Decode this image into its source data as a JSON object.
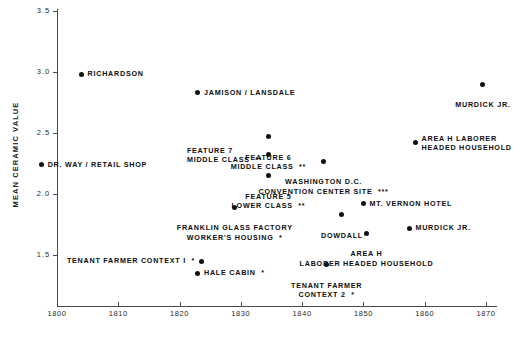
{
  "chart_data": {
    "type": "scatter",
    "title": "",
    "xlabel": "",
    "ylabel": "MEAN CERAMIC VALUE",
    "xlim": [
      1797,
      1874
    ],
    "ylim": [
      1.26,
      3.55
    ],
    "grid": false,
    "legend": "none",
    "xticks": [
      1800,
      1810,
      1820,
      1830,
      1840,
      1850,
      1860,
      1870
    ],
    "xtick_labels": [
      "1800",
      "1810",
      "1820",
      "1830",
      "1840",
      "1850",
      "1860",
      "1870"
    ],
    "yticks": [
      1.5,
      2.0,
      2.5,
      3.0,
      3.5
    ],
    "ytick_labels": [
      "1.5",
      "2.0",
      "2.5",
      "3.0",
      "3.5"
    ],
    "points": [
      {
        "label": "RICHARDSON",
        "x": 1804.0,
        "y": 2.98,
        "align": "left"
      },
      {
        "label": "JAMISON / LANSDALE",
        "x": 1823.0,
        "y": 2.83,
        "align": "left"
      },
      {
        "label": "MURDICK JR.",
        "x": 1869.5,
        "y": 2.9,
        "align": "centerb"
      },
      {
        "label": "FEATURE 6\nMIDDLE CLASS  **",
        "x": 1834.5,
        "y": 2.47,
        "align": "centerb"
      },
      {
        "label": "FEATURE 7\nMIDDLE CLASS  **",
        "x": 1834.5,
        "y": 2.32,
        "align": "right"
      },
      {
        "label": "AREA H LABORER\nHEADED HOUSEHOLD",
        "x": 1858.5,
        "y": 2.42,
        "align": "left"
      },
      {
        "label": "WASHINGTON D.C.\nCONVENTION CENTER SITE  ***",
        "x": 1843.5,
        "y": 2.27,
        "align": "centerb"
      },
      {
        "label": "DR. WAY / RETAIL SHOP",
        "x": 1797.5,
        "y": 2.24,
        "align": "left"
      },
      {
        "label": "FEATURE 5\nLOWER CLASS  **",
        "x": 1834.5,
        "y": 2.15,
        "align": "centerb"
      },
      {
        "label": "MT. VERNON HOTEL",
        "x": 1850.0,
        "y": 1.92,
        "align": "left"
      },
      {
        "label": "FRANKLIN GLASS FACTORY\nWORKER'S HOUSING  *",
        "x": 1829.0,
        "y": 1.89,
        "align": "centerb"
      },
      {
        "label": "DOWDALL",
        "x": 1846.5,
        "y": 1.83,
        "align": "centerb"
      },
      {
        "label": "MURDICK JR.",
        "x": 1857.5,
        "y": 1.72,
        "align": "left"
      },
      {
        "label": "AREA H\nLABORER HEADED HOUSEHOLD",
        "x": 1850.5,
        "y": 1.68,
        "align": "centerb"
      },
      {
        "label": "TENANT FARMER CONTEXT I  *",
        "x": 1823.5,
        "y": 1.45,
        "align": "right"
      },
      {
        "label": "HALE CABIN  *",
        "x": 1823.0,
        "y": 1.35,
        "align": "left"
      },
      {
        "label": "TENANT FARMER\nCONTEXT 2  *",
        "x": 1844.0,
        "y": 1.42,
        "align": "centerb"
      }
    ]
  },
  "colors": {
    "marker": "#111111",
    "axis": "#4a4a4a",
    "text": "#0d0d0d",
    "background": "#ffffff"
  }
}
